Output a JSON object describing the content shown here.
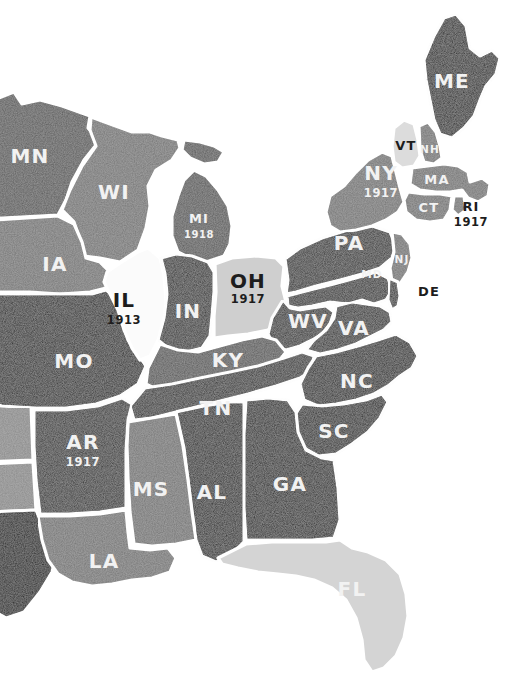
{
  "map": {
    "title": "Eastern United States state map",
    "background_color": "#ffffff",
    "border_color": "#ffffff",
    "palette": {
      "very_dark": "#232323",
      "dark": "#2e2e2e",
      "mid_dark": "#5c5c5c",
      "mid": "#767676",
      "light_mid": "#8a8a8a",
      "light": "#cfcfcf",
      "very_light": "#dcdcdc",
      "white": "#fbfbfb",
      "label_light": "#f2f2f2",
      "label_dark": "#1d1d1d"
    },
    "states": [
      {
        "id": "ME",
        "abbr": "ME",
        "year": "",
        "fill": "#232323",
        "label_color": "light",
        "lx": 452,
        "ly": 88,
        "size": "lg"
      },
      {
        "id": "VT",
        "abbr": "VT",
        "year": "",
        "fill": "#dcdcdc",
        "label_color": "dark",
        "lx": 406,
        "ly": 145,
        "size": "md"
      },
      {
        "id": "NH",
        "abbr": "NH",
        "year": "",
        "fill": "#767676",
        "label_color": "light",
        "lx": 430,
        "ly": 154,
        "size": "xs"
      },
      {
        "id": "MA",
        "abbr": "MA",
        "year": "",
        "fill": "#767676",
        "label_color": "light",
        "lx": 437,
        "ly": 179,
        "size": "sm"
      },
      {
        "id": "CT",
        "abbr": "CT",
        "year": "",
        "fill": "#767676",
        "label_color": "light",
        "lx": 430,
        "ly": 206,
        "size": "sm"
      },
      {
        "id": "RI",
        "abbr": "RI",
        "year": "1917",
        "fill": "#767676",
        "label_color": "dark",
        "lx": 471,
        "ly": 209,
        "size": "sm"
      },
      {
        "id": "NY",
        "abbr": "NY",
        "year": "1917",
        "fill": "#767676",
        "label_color": "light",
        "lx": 381,
        "ly": 177,
        "size": "md"
      },
      {
        "id": "PA",
        "abbr": "PA",
        "year": "",
        "fill": "#2e2e2e",
        "label_color": "light",
        "lx": 349,
        "ly": 242,
        "size": "lg"
      },
      {
        "id": "NJ",
        "abbr": "NJ",
        "year": "",
        "fill": "#767676",
        "label_color": "light",
        "lx": 405,
        "ly": 261,
        "size": "xs"
      },
      {
        "id": "MD",
        "abbr": "MD",
        "year": "",
        "fill": "#2e2e2e",
        "label_color": "light",
        "lx": 374,
        "ly": 276,
        "size": "xs"
      },
      {
        "id": "DE",
        "abbr": "DE",
        "year": "",
        "fill": "#2e2e2e",
        "label_color": "dark",
        "lx": 429,
        "ly": 292,
        "size": "sm"
      },
      {
        "id": "WV",
        "abbr": "WV",
        "year": "",
        "fill": "#2e2e2e",
        "label_color": "light",
        "lx": 308,
        "ly": 322,
        "size": "md"
      },
      {
        "id": "VA",
        "abbr": "VA",
        "year": "",
        "fill": "#2e2e2e",
        "label_color": "light",
        "lx": 354,
        "ly": 328,
        "size": "md"
      },
      {
        "id": "NC",
        "abbr": "NC",
        "year": "",
        "fill": "#232323",
        "label_color": "light",
        "lx": 357,
        "ly": 381,
        "size": "lg"
      },
      {
        "id": "SC",
        "abbr": "SC",
        "year": "",
        "fill": "#232323",
        "label_color": "light",
        "lx": 334,
        "ly": 431,
        "size": "lg"
      },
      {
        "id": "GA",
        "abbr": "GA",
        "year": "",
        "fill": "#232323",
        "label_color": "light",
        "lx": 290,
        "ly": 484,
        "size": "lg"
      },
      {
        "id": "FL",
        "abbr": "FL",
        "year": "",
        "fill": "#d4d4d4",
        "label_color": "light",
        "lx": 352,
        "ly": 589,
        "size": "lg"
      },
      {
        "id": "AL",
        "abbr": "AL",
        "year": "",
        "fill": "#232323",
        "label_color": "light",
        "lx": 212,
        "ly": 492,
        "size": "lg"
      },
      {
        "id": "MS",
        "abbr": "MS",
        "year": "",
        "fill": "#767676",
        "label_color": "light",
        "lx": 150,
        "ly": 489,
        "size": "lg"
      },
      {
        "id": "LA",
        "abbr": "LA",
        "year": "",
        "fill": "#767676",
        "label_color": "light",
        "lx": 104,
        "ly": 561,
        "size": "lg"
      },
      {
        "id": "AR",
        "abbr": "AR",
        "year": "1917",
        "fill": "#2e2e2e",
        "label_color": "light",
        "lx": 83,
        "ly": 445,
        "size": "lg"
      },
      {
        "id": "TN",
        "abbr": "TN",
        "year": "",
        "fill": "#2e2e2e",
        "label_color": "light",
        "lx": 216,
        "ly": 408,
        "size": "lg"
      },
      {
        "id": "KY",
        "abbr": "KY",
        "year": "",
        "fill": "#5c5c5c",
        "label_color": "light",
        "lx": 228,
        "ly": 360,
        "size": "lg"
      },
      {
        "id": "MO",
        "abbr": "MO",
        "year": "",
        "fill": "#232323",
        "label_color": "light",
        "lx": 74,
        "ly": 361,
        "size": "lg"
      },
      {
        "id": "IL",
        "abbr": "IL",
        "year": "1913",
        "fill": "#fbfbfb",
        "label_color": "dark",
        "lx": 124,
        "ly": 301,
        "size": "lg"
      },
      {
        "id": "IN",
        "abbr": "IN",
        "year": "",
        "fill": "#2e2e2e",
        "label_color": "light",
        "lx": 188,
        "ly": 311,
        "size": "lg"
      },
      {
        "id": "OH",
        "abbr": "OH",
        "year": "1917",
        "fill": "#cfcfcf",
        "label_color": "dark",
        "lx": 248,
        "ly": 280,
        "size": "lg"
      },
      {
        "id": "MI",
        "abbr": "MI",
        "year": "1918",
        "fill": "#5c5c5c",
        "label_color": "light",
        "lx": 199,
        "ly": 219,
        "size": "md"
      },
      {
        "id": "WI",
        "abbr": "WI",
        "year": "",
        "fill": "#767676",
        "label_color": "light",
        "lx": 114,
        "ly": 192,
        "size": "lg"
      },
      {
        "id": "MN",
        "abbr": "MN",
        "year": "",
        "fill": "#5c5c5c",
        "label_color": "light",
        "lx": 29,
        "ly": 156,
        "size": "lg"
      },
      {
        "id": "IA",
        "abbr": "IA",
        "year": "",
        "fill": "#767676",
        "label_color": "light",
        "lx": 55,
        "ly": 264,
        "size": "lg"
      }
    ],
    "unlabeled_regions": [
      {
        "id": "edge-nebraska",
        "fill": "#767676"
      },
      {
        "id": "edge-kansas",
        "fill": "#8a8a8a"
      },
      {
        "id": "edge-oklahoma",
        "fill": "#232323"
      },
      {
        "id": "edge-texas",
        "fill": "#232323"
      }
    ]
  }
}
